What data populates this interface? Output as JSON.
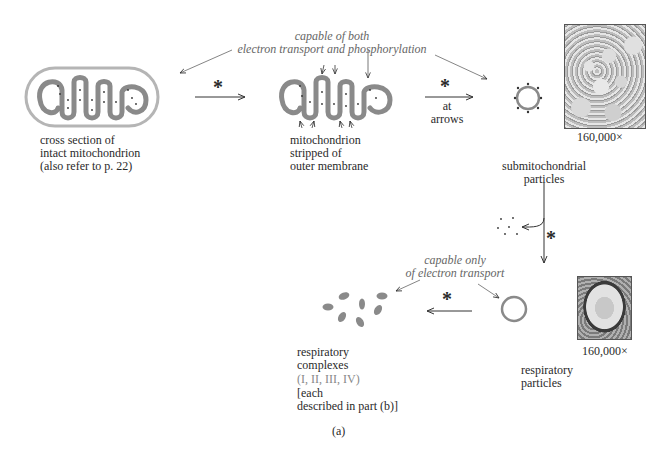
{
  "figure": {
    "panel_label": "(a)",
    "step_marker": "*",
    "annotations": {
      "both": {
        "line1": "capable of both",
        "line2": "electron transport and phosphorylation"
      },
      "only": {
        "line1": "capable only",
        "line2": "of electron transport"
      }
    },
    "stages": [
      {
        "id": "intact",
        "label_lines": [
          "cross section of",
          "intact mitochondrion",
          "(also refer to p. 22)"
        ]
      },
      {
        "id": "stripped",
        "label_lines": [
          "mitochondrion",
          "stripped of",
          "outer membrane"
        ]
      },
      {
        "id": "submito",
        "label_lines": [
          "submitochondrial",
          "particles"
        ],
        "magnification": "160,000×"
      },
      {
        "id": "respiratory_particles",
        "label_lines": [
          "respiratory",
          "particles"
        ],
        "magnification": "160,000×"
      },
      {
        "id": "complexes",
        "label_lines": [
          "respiratory",
          "complexes"
        ],
        "sub_label": "(I, II, III, IV)",
        "note_lines": [
          "[each",
          "described in part (b)]"
        ]
      }
    ],
    "arrows": [
      {
        "from": "intact",
        "to": "stripped",
        "marker": "*"
      },
      {
        "from": "stripped",
        "to": "submito",
        "marker": "*",
        "caption_lines": [
          "at",
          "arrows"
        ]
      },
      {
        "from": "submito",
        "to": "respiratory_particles",
        "marker": "*"
      },
      {
        "from": "respiratory_particles",
        "to": "complexes",
        "marker": "*"
      }
    ],
    "colors": {
      "membrane": "#8a8a8a",
      "text": "#2a2a2a",
      "annotation": "#666666",
      "sub_label": "#888888"
    }
  }
}
